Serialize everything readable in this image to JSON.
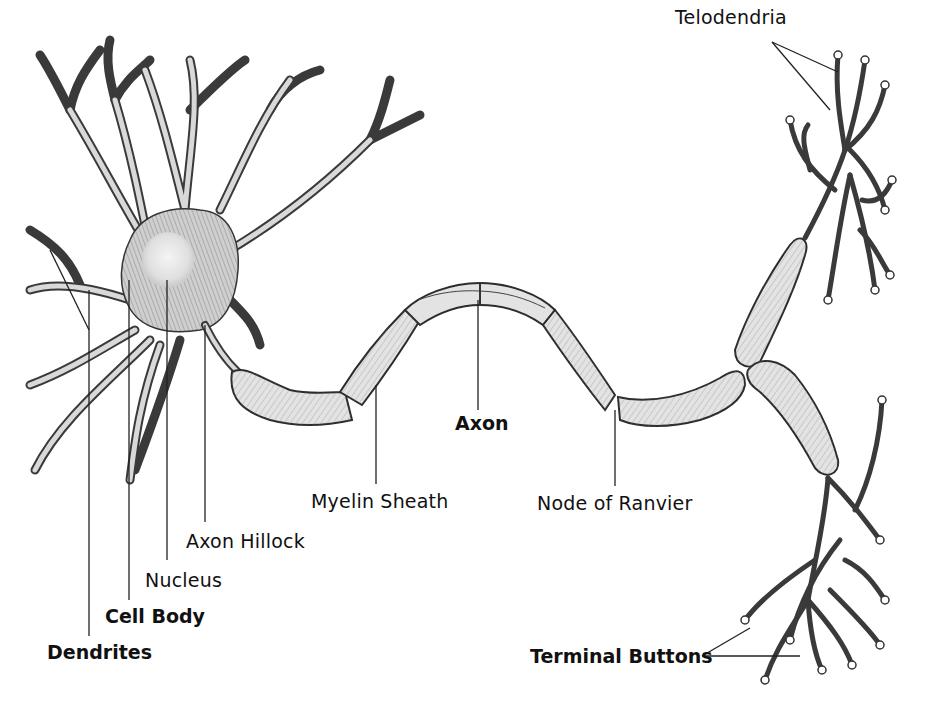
{
  "diagram": {
    "colors": {
      "background": "#ffffff",
      "ink": "#222222",
      "fill": "#e3e3e3",
      "shade": "#9a9a9a"
    },
    "labels": {
      "telodendria": "Telodendria",
      "axon": "Axon",
      "myelin_sheath": "Myelin Sheath",
      "node_of_ranvier": "Node of Ranvier",
      "axon_hillock": "Axon Hillock",
      "nucleus": "Nucleus",
      "cell_body": "Cell Body",
      "dendrites": "Dendrites",
      "terminal_buttons": "Terminal Buttons"
    },
    "components": [
      {
        "name": "Dendrites",
        "bold": true
      },
      {
        "name": "Cell Body",
        "bold": true
      },
      {
        "name": "Nucleus",
        "bold": false
      },
      {
        "name": "Axon Hillock",
        "bold": false
      },
      {
        "name": "Myelin Sheath",
        "bold": false
      },
      {
        "name": "Axon",
        "bold": true
      },
      {
        "name": "Node of Ranvier",
        "bold": false
      },
      {
        "name": "Telodendria",
        "bold": false
      },
      {
        "name": "Terminal Buttons",
        "bold": true
      }
    ]
  }
}
